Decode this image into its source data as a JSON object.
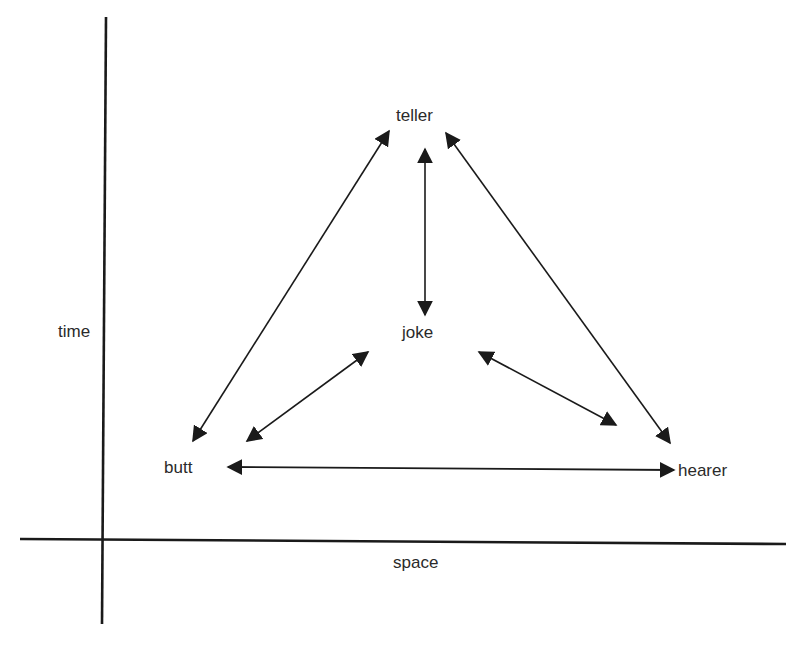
{
  "diagram": {
    "type": "relationship-triangle",
    "colors": {
      "line": "#1a1a1a",
      "text": "#2a2a2a",
      "background": "#ffffff"
    },
    "axes": {
      "x_label": "space",
      "y_label": "time"
    },
    "nodes": [
      {
        "id": "teller",
        "label": "teller"
      },
      {
        "id": "joke",
        "label": "joke"
      },
      {
        "id": "butt",
        "label": "butt"
      },
      {
        "id": "hearer",
        "label": "hearer"
      }
    ],
    "edges": [
      {
        "from": "teller",
        "to": "butt",
        "direction": "bidirectional"
      },
      {
        "from": "teller",
        "to": "joke",
        "direction": "bidirectional"
      },
      {
        "from": "teller",
        "to": "hearer",
        "direction": "bidirectional"
      },
      {
        "from": "butt",
        "to": "joke",
        "direction": "bidirectional"
      },
      {
        "from": "joke",
        "to": "hearer",
        "direction": "bidirectional"
      },
      {
        "from": "butt",
        "to": "hearer",
        "direction": "bidirectional"
      }
    ]
  }
}
